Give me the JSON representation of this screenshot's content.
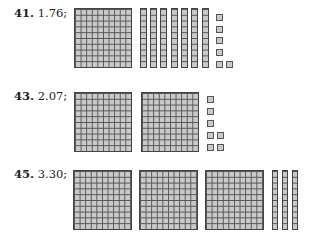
{
  "problems": [
    {
      "number": "41.",
      "value": "1.76;",
      "flats": 1,
      "rods": 7,
      "units": 6
    },
    {
      "number": "43.",
      "value": "2.07;",
      "flats": 2,
      "rods": 0,
      "units": 7
    },
    {
      "number": "45.",
      "value": "3.30;",
      "flats": 3,
      "rods": 3,
      "units": 0
    }
  ],
  "colors": {
    "block_fill": "#c9c9c9",
    "grid_line": "#555555"
  }
}
